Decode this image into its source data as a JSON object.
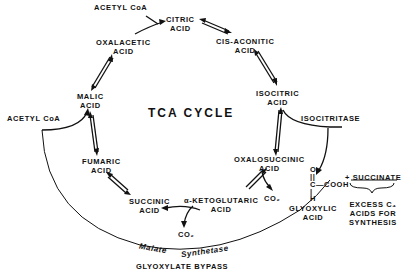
{
  "diagram": {
    "title": "TCA CYCLE",
    "nodes": {
      "acetyl_coa_top": "ACETYL CoA",
      "citric": [
        "CITRIC",
        "ACID"
      ],
      "cis_aconitic": [
        "CIS-ACONITIC",
        "ACID"
      ],
      "isocitric": [
        "ISOCITRIC",
        "ACID"
      ],
      "oxalosuccinic": [
        "OXALOSUCCINIC",
        "ACID"
      ],
      "alpha_ketoglutaric": [
        "α-KETOGLUTARIC",
        "ACID"
      ],
      "succinic": [
        "SUCCINIC",
        "ACID"
      ],
      "fumaric": [
        "FUMARIC",
        "ACID"
      ],
      "malic": [
        "MALIC",
        "ACID"
      ],
      "oxalacetic": [
        "OXALACETIC",
        "ACID"
      ],
      "acetyl_coa_left": "ACETYL CoA",
      "co2_oxalo": "CO₂",
      "co2_keto": "CO₂",
      "glyoxylic": [
        "GLYOXYLIC",
        "ACID"
      ]
    },
    "enzymes": {
      "isocitritase": "ISOCITRITASE",
      "malate_synthetase": [
        "Malate",
        "Synthetase"
      ]
    },
    "glyoxylate_structure": {
      "o": "O",
      "dbl": "||",
      "c": "C—COOH",
      "single": "|",
      "h": "H"
    },
    "succinate_label": "+ SUCCINATE",
    "excess_note": [
      "EXCESS  C₄",
      "ACIDS FOR",
      "SYNTHESIS"
    ],
    "bypass_label": "GLYOXYLATE BYPASS"
  }
}
